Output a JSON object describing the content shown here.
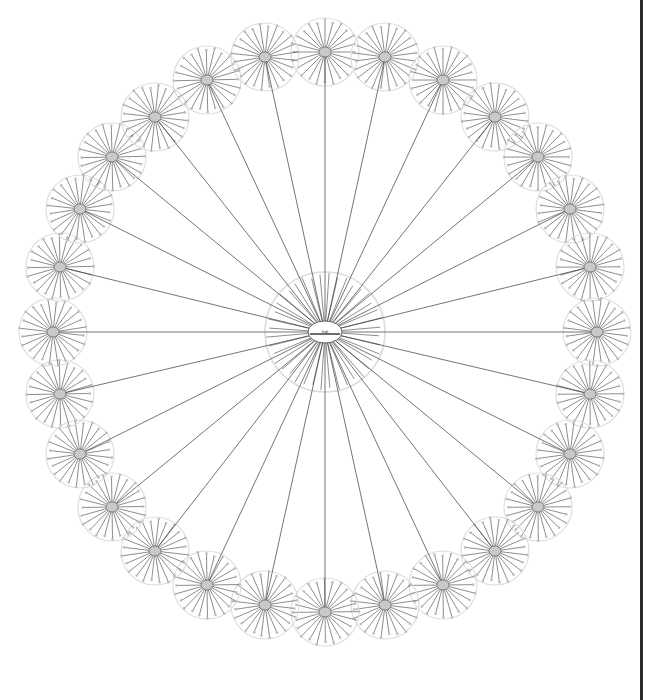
{
  "canvas": {
    "width": 650,
    "height": 700,
    "background": "#ffffff"
  },
  "visualization": {
    "kind": "radial-hierarchical-network-graph",
    "description": "Star-of-stars network diagram: one central hub node connected by straight edges to a ring of satellite hub nodes, each satellite itself a small radial star of spokes ending in leaf nodes."
  },
  "style": {
    "edge_color": "#3a3a3a",
    "edge_width": 0.7,
    "spoke_color": "#404040",
    "spoke_width": 0.6,
    "leaf_color": "#bdbdbd",
    "hub_fill": "#c9c9c9",
    "hub_stroke": "#555555",
    "ring_color": "#dcdcdc",
    "center_label_color": "#333333",
    "border_color": "#2a2a2a"
  },
  "center_node": {
    "id": "hub-0",
    "label": "hub",
    "cx": 325,
    "cy": 332,
    "ring_radius": 60,
    "core_rx": 17,
    "core_ry": 11,
    "spoke_count": 40
  },
  "satellite_ring": {
    "count": 28,
    "radius_x": 272,
    "radius_y": 280,
    "node_radius": 34,
    "spokes_per_node": 24,
    "start_angle_deg": -90,
    "hub_rx": 6,
    "hub_ry": 5
  },
  "satellites": [
    {
      "id": "n01",
      "angle": -90,
      "cx": 325,
      "cy": 52
    },
    {
      "id": "n02",
      "angle": -77.14,
      "cx": 385,
      "cy": 57
    },
    {
      "id": "n03",
      "angle": -64.29,
      "cx": 443,
      "cy": 80
    },
    {
      "id": "n04",
      "angle": -51.43,
      "cx": 495,
      "cy": 117
    },
    {
      "id": "n05",
      "angle": -38.57,
      "cx": 538,
      "cy": 157
    },
    {
      "id": "n06",
      "angle": -25.71,
      "cx": 570,
      "cy": 209
    },
    {
      "id": "n07",
      "angle": -12.86,
      "cx": 590,
      "cy": 267
    },
    {
      "id": "n08",
      "angle": 0,
      "cx": 597,
      "cy": 332
    },
    {
      "id": "n09",
      "angle": 12.86,
      "cx": 590,
      "cy": 394
    },
    {
      "id": "n10",
      "angle": 25.71,
      "cx": 570,
      "cy": 454
    },
    {
      "id": "n11",
      "angle": 38.57,
      "cx": 538,
      "cy": 507
    },
    {
      "id": "n12",
      "angle": 51.43,
      "cx": 495,
      "cy": 551
    },
    {
      "id": "n13",
      "angle": 64.29,
      "cx": 443,
      "cy": 585
    },
    {
      "id": "n14",
      "angle": 77.14,
      "cx": 385,
      "cy": 605
    },
    {
      "id": "n15",
      "angle": 90,
      "cx": 325,
      "cy": 612
    },
    {
      "id": "n16",
      "angle": 102.86,
      "cx": 265,
      "cy": 605
    },
    {
      "id": "n17",
      "angle": 115.71,
      "cx": 207,
      "cy": 585
    },
    {
      "id": "n18",
      "angle": 128.57,
      "cx": 155,
      "cy": 551
    },
    {
      "id": "n19",
      "angle": 141.43,
      "cx": 112,
      "cy": 507
    },
    {
      "id": "n20",
      "angle": 154.29,
      "cx": 80,
      "cy": 454
    },
    {
      "id": "n21",
      "angle": 167.14,
      "cx": 60,
      "cy": 394
    },
    {
      "id": "n22",
      "angle": 180,
      "cx": 53,
      "cy": 332
    },
    {
      "id": "n23",
      "angle": 192.86,
      "cx": 60,
      "cy": 267
    },
    {
      "id": "n24",
      "angle": 205.71,
      "cx": 80,
      "cy": 209
    },
    {
      "id": "n25",
      "angle": 218.57,
      "cx": 112,
      "cy": 157
    },
    {
      "id": "n26",
      "angle": 231.43,
      "cx": 155,
      "cy": 117
    },
    {
      "id": "n27",
      "angle": 244.29,
      "cx": 207,
      "cy": 80
    },
    {
      "id": "n28",
      "angle": 257.14,
      "cx": 265,
      "cy": 57
    }
  ],
  "right_border": {
    "x": 640,
    "width": 3,
    "visible": true
  }
}
